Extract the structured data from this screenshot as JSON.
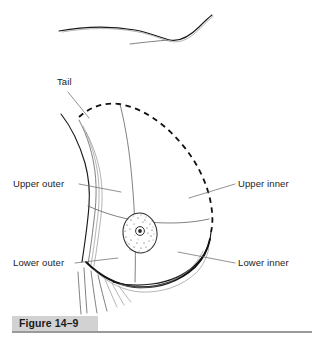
{
  "figure": {
    "caption": "Figure 14–9",
    "background_color": "#ffffff",
    "line_color": "#1a1a1a",
    "caption_bar_color": "#d2d2d2",
    "caption_rule_color": "#9a9a9a",
    "text_color": "#1c1c1c"
  },
  "labels": {
    "tail": "Tail",
    "upper_outer": "Upper outer",
    "upper_inner": "Upper inner",
    "lower_outer": "Lower outer",
    "lower_inner": "Lower inner"
  },
  "structures": {
    "areola": "areola",
    "nipple": "nipple",
    "clavicle_contour": "clavicle-shoulder-contour",
    "axillary_tail_outline": "dashed-tail-of-spence-outline",
    "inframammary_fold": "inframammary-fold",
    "chest_wall_hatching": "chest-wall-hatching",
    "vertical_divider": "vertical-quadrant-divider",
    "horizontal_divider": "horizontal-quadrant-divider"
  }
}
